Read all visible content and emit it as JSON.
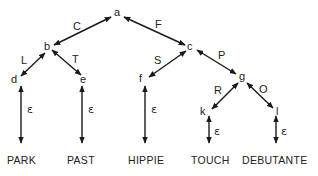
{
  "diagram": {
    "type": "tree",
    "nodes": [
      {
        "id": "a",
        "label": "a"
      },
      {
        "id": "b",
        "label": "b"
      },
      {
        "id": "c",
        "label": "c"
      },
      {
        "id": "d",
        "label": "d"
      },
      {
        "id": "e",
        "label": "e"
      },
      {
        "id": "f",
        "label": "f"
      },
      {
        "id": "g",
        "label": "g"
      },
      {
        "id": "k",
        "label": "k"
      },
      {
        "id": "l",
        "label": "l"
      }
    ],
    "edges": [
      {
        "from": "a",
        "to": "b",
        "label": "C"
      },
      {
        "from": "a",
        "to": "c",
        "label": "F"
      },
      {
        "from": "b",
        "to": "d",
        "label": "L"
      },
      {
        "from": "b",
        "to": "e",
        "label": "T"
      },
      {
        "from": "c",
        "to": "f",
        "label": "S"
      },
      {
        "from": "c",
        "to": "g",
        "label": "P"
      },
      {
        "from": "g",
        "to": "k",
        "label": "R"
      },
      {
        "from": "g",
        "to": "l",
        "label": "O"
      }
    ],
    "epsilon_label": "ε",
    "leaves": [
      {
        "node": "d",
        "word": "PARK",
        "edge_label": "ε"
      },
      {
        "node": "e",
        "word": "PAST",
        "edge_label": "ε"
      },
      {
        "node": "f",
        "word": "HIPPIE",
        "edge_label": "ε"
      },
      {
        "node": "k",
        "word": "TOUCH",
        "edge_label": "ε"
      },
      {
        "node": "l",
        "word": "DEBUTANTE",
        "edge_label": "ε"
      }
    ]
  }
}
